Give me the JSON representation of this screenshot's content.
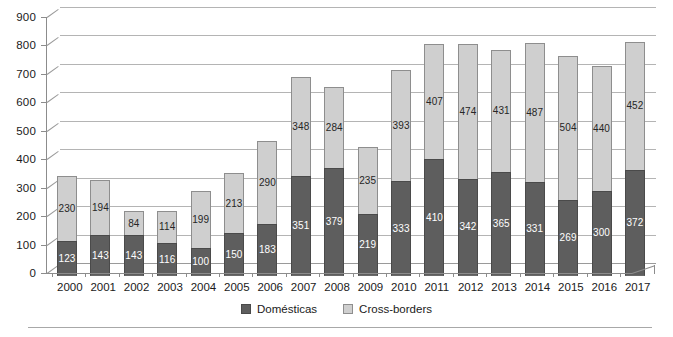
{
  "chart_data": {
    "type": "bar",
    "stacked": true,
    "title": "",
    "subtitle": "",
    "xlabel": "",
    "ylabel": "",
    "ylim": [
      0,
      900
    ],
    "ytick_step": 100,
    "yticks": [
      900,
      800,
      700,
      600,
      500,
      400,
      300,
      200,
      100,
      0
    ],
    "grid": true,
    "grid_orientation": "horizontal",
    "legend_position": "bottom-center",
    "categories": [
      "2000",
      "2001",
      "2002",
      "2003",
      "2004",
      "2005",
      "2006",
      "2007",
      "2008",
      "2009",
      "2010",
      "2011",
      "2012",
      "2013",
      "2014",
      "2015",
      "2016",
      "2017"
    ],
    "series": [
      {
        "name": "Domésticas",
        "color": "#5e5e5e",
        "values": [
          123,
          143,
          143,
          116,
          100,
          150,
          183,
          351,
          379,
          219,
          333,
          410,
          342,
          365,
          331,
          269,
          300,
          372
        ]
      },
      {
        "name": "Cross-borders",
        "color": "#cfcfcf",
        "values": [
          230,
          194,
          84,
          114,
          199,
          213,
          290,
          348,
          284,
          235,
          393,
          407,
          474,
          431,
          487,
          504,
          440,
          452
        ]
      }
    ],
    "totals": [
      353,
      337,
      227,
      230,
      299,
      363,
      473,
      699,
      663,
      454,
      726,
      817,
      816,
      796,
      818,
      773,
      740,
      824
    ]
  },
  "legend": {
    "items": [
      {
        "label": "Domésticas",
        "swatch": "dark-gray-swatch"
      },
      {
        "label": "Cross-borders",
        "swatch": "light-gray-swatch"
      }
    ]
  }
}
